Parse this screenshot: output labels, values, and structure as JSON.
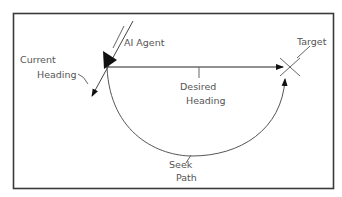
{
  "diagram": {
    "type": "seek-steering-behavior",
    "labels": {
      "agent": "AI Agent",
      "current_heading_line1": "Current",
      "current_heading_line2": "Heading",
      "target": "Target",
      "desired_heading_line1": "Desired",
      "desired_heading_line2": "Heading",
      "seek_path_line1": "Seek",
      "seek_path_line2": "Path"
    },
    "colors": {
      "frame": "#3a3a3a",
      "lines": "#666666",
      "arrows": "#111111",
      "text": "#555555"
    }
  }
}
